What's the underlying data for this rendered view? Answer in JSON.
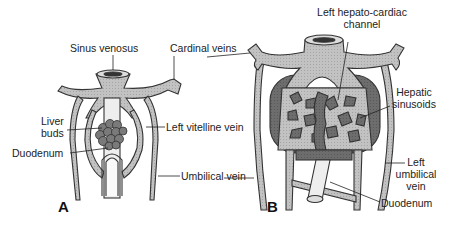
{
  "figure": {
    "panels": [
      {
        "letter": "A",
        "labels": {
          "sinus_venosus": "Sinus venosus",
          "cardinal_veins": "Cardinal veins",
          "liver_buds_1": "Liver",
          "liver_buds_2": "buds",
          "left_vitelline_vein": "Left vitelline vein",
          "duodenum": "Duodenum",
          "umbilical_vein": "Umbilical vein"
        }
      },
      {
        "letter": "B",
        "labels": {
          "left_hepato_cardiac_1": "Left hepato-cardiac",
          "left_hepato_cardiac_2": "channel",
          "hepatic_sinusoids_1": "Hepatic",
          "hepatic_sinusoids_2": "sinusoids",
          "left_umbilical_1": "Left",
          "left_umbilical_2": "umbilical",
          "left_umbilical_3": "vein",
          "duodenum": "Duodenum"
        }
      }
    ],
    "colors": {
      "vessel_fill": "#bdbdbd",
      "vessel_stroke": "#333333",
      "liver_dark": "#6e6e6e",
      "bud_fill": "#7a7a7a",
      "gut_fill": "#eeeeee"
    }
  }
}
